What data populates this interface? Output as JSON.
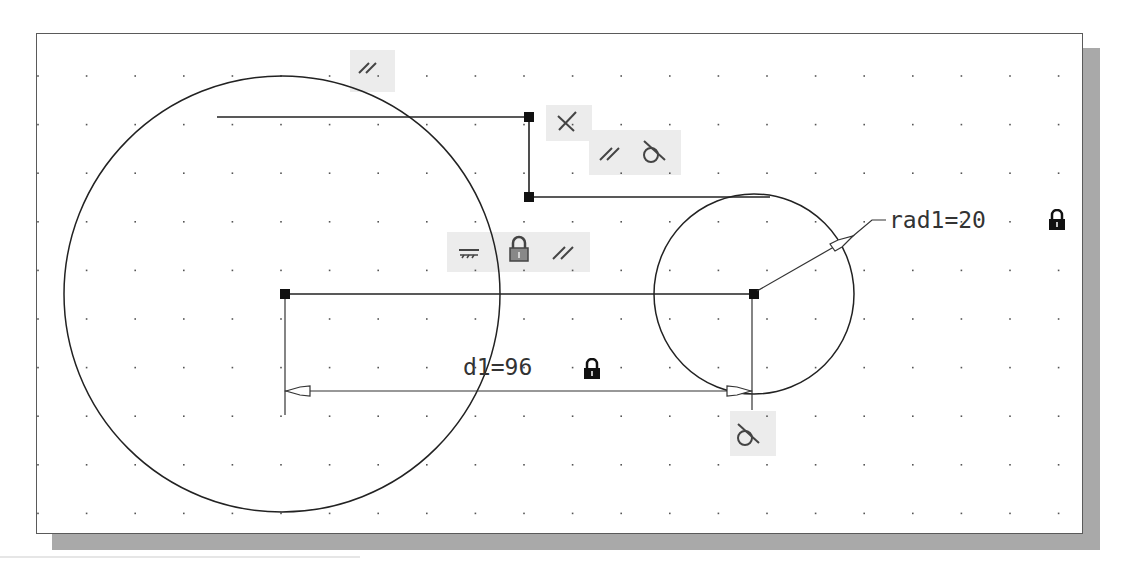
{
  "drawing": {
    "sheet": {
      "left": 36,
      "top": 33,
      "right": 1083,
      "bottom": 534,
      "shadow_color": "#a9a9a9",
      "border_color": "#5a5a5a"
    },
    "grid": {
      "x0": 38,
      "y0": 76,
      "spacing": 48.6,
      "cols": 22,
      "rows": 10,
      "dot_color": "#555555"
    },
    "geometry": {
      "large_circle": {
        "cx": 282,
        "cy": 294,
        "r": 218
      },
      "small_circle": {
        "cx": 754,
        "cy": 294,
        "r": 100
      },
      "lines": [
        {
          "x1": 217,
          "y1": 117,
          "x2": 529,
          "y2": 117
        },
        {
          "x1": 529,
          "y1": 117,
          "x2": 529,
          "y2": 197
        },
        {
          "x1": 529,
          "y1": 197,
          "x2": 770,
          "y2": 197
        },
        {
          "x1": 285,
          "y1": 294,
          "x2": 754,
          "y2": 294
        }
      ],
      "points": [
        {
          "x": 529,
          "y": 117
        },
        {
          "x": 529,
          "y": 197
        },
        {
          "x": 285,
          "y": 294
        },
        {
          "x": 754,
          "y": 294
        }
      ]
    },
    "dimensions": {
      "linear": {
        "label": "d1=96",
        "x1": 285,
        "x2": 754,
        "y": 391,
        "ext_bottom_left": 415,
        "ext_bottom_right": 410,
        "locked": true
      },
      "radial": {
        "label": "rad1=20",
        "locked": true
      }
    },
    "constraints": [
      {
        "id": "parallel-top",
        "symbols": [
          "parallel"
        ]
      },
      {
        "id": "perpendicular",
        "symbols": [
          "perpendicular"
        ]
      },
      {
        "id": "parallel-tangent",
        "symbols": [
          "parallel",
          "tangent"
        ]
      },
      {
        "id": "horizontal-fix-parallel",
        "symbols": [
          "fix",
          "lock",
          "parallel"
        ]
      },
      {
        "id": "tangent-bottom",
        "symbols": [
          "tangent"
        ]
      }
    ]
  }
}
